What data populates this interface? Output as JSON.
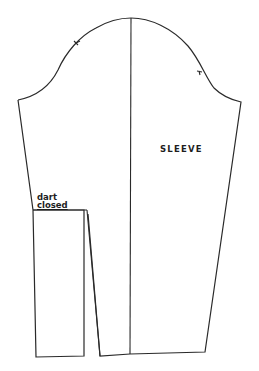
{
  "diagram": {
    "labels": {
      "piece_name": "SLEEVE",
      "dart_line1": "dart",
      "dart_line2": "closed"
    },
    "colors": {
      "line": "#2a2a2a",
      "background": "#ffffff"
    },
    "elements": [
      {
        "name": "sleeve-cap-curve",
        "type": "curve"
      },
      {
        "name": "center-grain-line",
        "type": "line"
      },
      {
        "name": "balance-notch-front",
        "type": "notch"
      },
      {
        "name": "balance-notch-back",
        "type": "notch"
      },
      {
        "name": "dart-closed-panel",
        "type": "shape"
      },
      {
        "name": "sleeve-main-panel",
        "type": "shape"
      }
    ]
  }
}
